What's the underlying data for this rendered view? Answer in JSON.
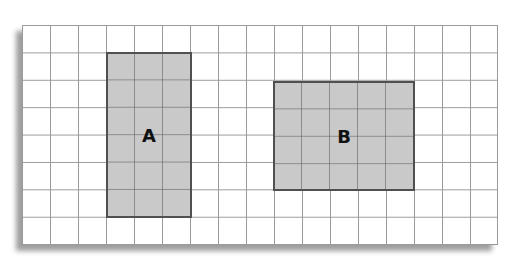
{
  "diagram": {
    "type": "grid-area-comparison",
    "grid": {
      "columns": 17,
      "rows": 8,
      "line_color": "#9a9a9a",
      "background": "#ffffff"
    },
    "shapes": [
      {
        "label": "A",
        "col_start": 3,
        "row_start": 1,
        "width_units": 3,
        "height_units": 6,
        "fill": "#c9c9c9",
        "border": "#505050"
      },
      {
        "label": "B",
        "col_start": 9,
        "row_start": 2,
        "width_units": 5,
        "height_units": 4,
        "fill": "#c9c9c9",
        "border": "#505050"
      }
    ]
  }
}
